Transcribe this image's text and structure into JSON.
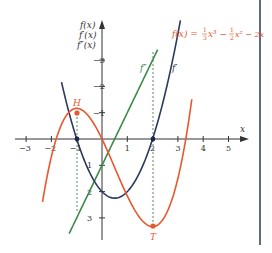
{
  "chart_data": {
    "type": "line",
    "title": "",
    "function_label": "f(x) = 1/3 x³ − 1/2 x² − 2x",
    "xlabel": "x",
    "ylabel_lines": [
      "f(x)",
      "f′(x)",
      "f″(x)"
    ],
    "xlim": [
      -3.2,
      5.6
    ],
    "ylim": [
      -3.7,
      3.6
    ],
    "x_ticks": [
      -3,
      -2,
      -1,
      1,
      2,
      3,
      4,
      5
    ],
    "y_ticks": [
      -3,
      -2,
      -1,
      1,
      2,
      3
    ],
    "grid": false,
    "series": [
      {
        "name": "f",
        "expression": "1/3 x^3 - 1/2 x^2 - 2x",
        "color": "#e8582e",
        "domain": [
          -2.35,
          3.55
        ]
      },
      {
        "name": "f'",
        "expression": "x^2 - x - 2",
        "color": "#2b3a5c",
        "domain": [
          -1.6,
          3.1
        ]
      },
      {
        "name": "f''",
        "expression": "2x - 1",
        "color": "#3d8a4a",
        "domain": [
          -1.3,
          2.2
        ]
      }
    ],
    "points": [
      {
        "label": "H",
        "x": -1,
        "y": 1.1667,
        "color": "#e8582e"
      },
      {
        "label": "T",
        "x": 2,
        "y": -3.3333,
        "color": "#e8582e"
      },
      {
        "label": "",
        "x": -1,
        "y": 0,
        "color": "#1c2a4a"
      },
      {
        "label": "",
        "x": 2,
        "y": 0,
        "color": "#1c2a4a"
      }
    ],
    "curve_labels": [
      {
        "text": "f″",
        "x": 1.5,
        "y": 2.9
      },
      {
        "text": "f′",
        "x": 2.6,
        "y": 2.9
      }
    ]
  },
  "labels": {
    "x_axis": "x",
    "y_axis_1": "f(x)",
    "y_axis_2": "f′(x)",
    "y_axis_3": "f″(x)",
    "func_lhs": "f(x) = ",
    "func_rhs": "x³ − ",
    "func_rhs2": "x² − 2x",
    "frac1_num": "1",
    "frac1_den": "3",
    "frac2_num": "1",
    "frac2_den": "2",
    "point_H": "H",
    "point_T": "T",
    "curve_fpp": "f″",
    "curve_fp": "f′",
    "ticks_x": [
      "−3",
      "−2",
      "−1",
      "1",
      "2",
      "3",
      "4",
      "5"
    ],
    "ticks_y": [
      "3",
      "2",
      "1",
      "−1",
      "−2",
      "−3"
    ]
  }
}
